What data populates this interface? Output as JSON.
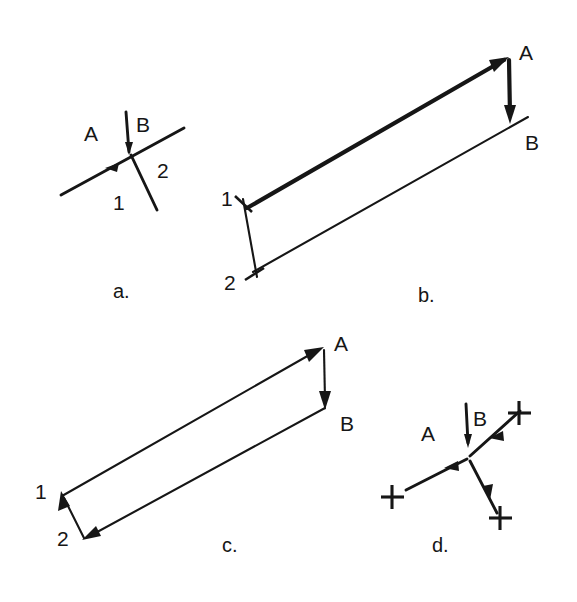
{
  "figure": {
    "type": "line-drawing-diagram",
    "width": 577,
    "height": 602,
    "background_color": "#ffffff",
    "ink_color": "#161616"
  },
  "panels": [
    {
      "id": "a",
      "caption": "a.",
      "caption_pos": {
        "x": 113,
        "y": 281
      },
      "kind": "junction",
      "labels": [
        {
          "name": "label-A",
          "text": "A",
          "x": 84,
          "y": 123
        },
        {
          "name": "label-B",
          "text": "B",
          "x": 136,
          "y": 114
        },
        {
          "name": "label-1",
          "text": "1",
          "x": 113,
          "y": 192
        },
        {
          "name": "label-2",
          "text": "2",
          "x": 157,
          "y": 160
        }
      ]
    },
    {
      "id": "b",
      "caption": "b.",
      "caption_pos": {
        "x": 418,
        "y": 285
      },
      "kind": "open-circuit",
      "labels": [
        {
          "name": "label-A",
          "text": "A",
          "x": 519,
          "y": 42
        },
        {
          "name": "label-B",
          "text": "B",
          "x": 525,
          "y": 132
        },
        {
          "name": "label-1",
          "text": "1",
          "x": 221,
          "y": 188
        },
        {
          "name": "label-2",
          "text": "2",
          "x": 224,
          "y": 272
        }
      ]
    },
    {
      "id": "c",
      "caption": "c.",
      "caption_pos": {
        "x": 222,
        "y": 535
      },
      "kind": "closed-circuit",
      "labels": [
        {
          "name": "label-A",
          "text": "A",
          "x": 334,
          "y": 333
        },
        {
          "name": "label-B",
          "text": "B",
          "x": 340,
          "y": 413
        },
        {
          "name": "label-1",
          "text": "1",
          "x": 35,
          "y": 481
        },
        {
          "name": "label-2",
          "text": "2",
          "x": 57,
          "y": 528
        }
      ]
    },
    {
      "id": "d",
      "caption": "d.",
      "caption_pos": {
        "x": 432,
        "y": 535
      },
      "kind": "junction-with-endpoints",
      "labels": [
        {
          "name": "label-A",
          "text": "A",
          "x": 421,
          "y": 423
        },
        {
          "name": "label-B",
          "text": "B",
          "x": 473,
          "y": 408
        }
      ]
    }
  ],
  "captions": {
    "a": "a.",
    "b": "b.",
    "c": "c.",
    "d": "d."
  },
  "vertex_labels": {
    "A": "A",
    "B": "B",
    "one": "1",
    "two": "2"
  }
}
